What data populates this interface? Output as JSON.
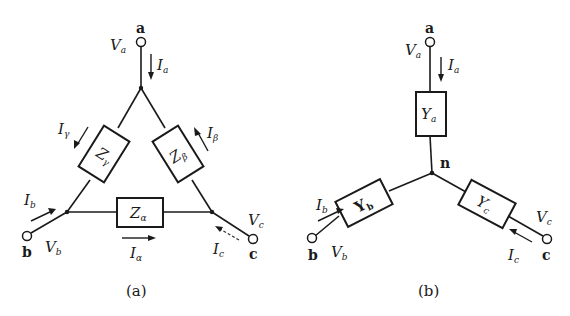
{
  "diagram_a": {
    "caption": "(a)",
    "topology": "delta",
    "terminals": {
      "a": {
        "label": "a",
        "voltage": "V",
        "voltage_sub": "a",
        "current": "I",
        "current_sub": "a"
      },
      "b": {
        "label": "b",
        "voltage": "V",
        "voltage_sub": "b",
        "current": "I",
        "current_sub": "b"
      },
      "c": {
        "label": "c",
        "voltage": "V",
        "voltage_sub": "c",
        "current": "I",
        "current_sub": "c"
      }
    },
    "impedances": {
      "alpha": {
        "label": "Z",
        "sub": "α",
        "current": "I",
        "current_sub": "α"
      },
      "beta": {
        "label": "Z",
        "sub": "β",
        "current": "I",
        "current_sub": "β"
      },
      "gamma": {
        "label": "Z",
        "sub": "γ",
        "current": "I",
        "current_sub": "γ"
      }
    }
  },
  "diagram_b": {
    "caption": "(b)",
    "topology": "wye",
    "neutral_label": "n",
    "terminals": {
      "a": {
        "label": "a",
        "voltage": "V",
        "voltage_sub": "a",
        "current": "I",
        "current_sub": "a"
      },
      "b": {
        "label": "b",
        "voltage": "V",
        "voltage_sub": "b",
        "current": "I",
        "current_sub": "b"
      },
      "c": {
        "label": "c",
        "voltage": "V",
        "voltage_sub": "c",
        "current": "I",
        "current_sub": "c"
      }
    },
    "admittances": {
      "a": {
        "label": "Y",
        "sub": "a"
      },
      "b": {
        "label": "Y",
        "sub": "b"
      },
      "c": {
        "label": "Y",
        "sub": "c"
      }
    }
  }
}
